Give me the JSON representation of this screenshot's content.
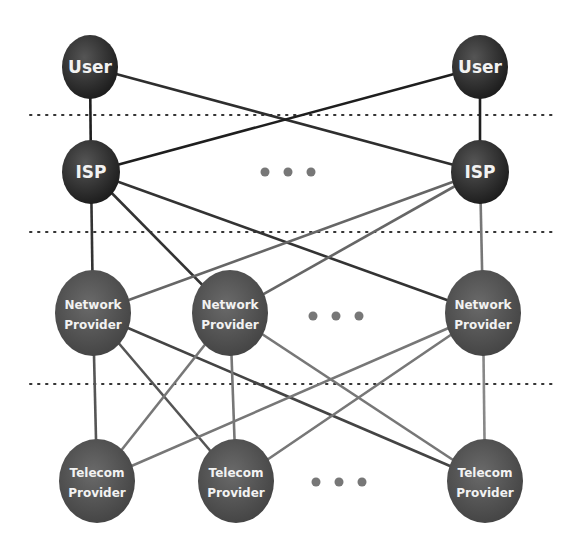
{
  "diagram": {
    "title": "",
    "layers": [
      {
        "name": "user",
        "separator_y": 115
      },
      {
        "name": "isp",
        "separator_y": 232
      },
      {
        "name": "network",
        "separator_y": 384
      },
      {
        "name": "telecom"
      }
    ],
    "nodes": [
      {
        "id": "user1",
        "layer": "user",
        "label": [
          "User"
        ],
        "cx": 90,
        "cy": 67,
        "rx": 28,
        "ry": 32,
        "fill": "#2a2a2a"
      },
      {
        "id": "user2",
        "layer": "user",
        "label": [
          "User"
        ],
        "cx": 480,
        "cy": 67,
        "rx": 28,
        "ry": 32,
        "fill": "#2a2a2a"
      },
      {
        "id": "isp1",
        "layer": "isp",
        "label": [
          "ISP"
        ],
        "cx": 91,
        "cy": 172,
        "rx": 29,
        "ry": 32,
        "fill": "#2a2a2a"
      },
      {
        "id": "isp2",
        "layer": "isp",
        "label": [
          "ISP"
        ],
        "cx": 480,
        "cy": 172,
        "rx": 29,
        "ry": 32,
        "fill": "#2a2a2a"
      },
      {
        "id": "net1",
        "layer": "network",
        "label": [
          "Network",
          "Provider"
        ],
        "cx": 93,
        "cy": 313,
        "rx": 38,
        "ry": 43,
        "fill": "#4d4d4d"
      },
      {
        "id": "net2",
        "layer": "network",
        "label": [
          "Network",
          "Provider"
        ],
        "cx": 230,
        "cy": 313,
        "rx": 38,
        "ry": 43,
        "fill": "#4d4d4d"
      },
      {
        "id": "net3",
        "layer": "network",
        "label": [
          "Network",
          "Provider"
        ],
        "cx": 483,
        "cy": 313,
        "rx": 38,
        "ry": 43,
        "fill": "#4d4d4d"
      },
      {
        "id": "tel1",
        "layer": "telecom",
        "label": [
          "Telecom",
          "Provider"
        ],
        "cx": 97,
        "cy": 481,
        "rx": 38,
        "ry": 42,
        "fill": "#555555"
      },
      {
        "id": "tel2",
        "layer": "telecom",
        "label": [
          "Telecom",
          "Provider"
        ],
        "cx": 236,
        "cy": 481,
        "rx": 38,
        "ry": 42,
        "fill": "#555555"
      },
      {
        "id": "tel3",
        "layer": "telecom",
        "label": [
          "Telecom",
          "Provider"
        ],
        "cx": 485,
        "cy": 481,
        "rx": 38,
        "ry": 42,
        "fill": "#555555"
      }
    ],
    "edges": [
      {
        "from": "user1",
        "to": "isp1",
        "color": "#1e1e1e"
      },
      {
        "from": "user1",
        "to": "isp2",
        "color": "#2e2e2e"
      },
      {
        "from": "user2",
        "to": "isp1",
        "color": "#1e1e1e"
      },
      {
        "from": "user2",
        "to": "isp2",
        "color": "#1e1e1e"
      },
      {
        "from": "isp1",
        "to": "net1",
        "color": "#333333"
      },
      {
        "from": "isp1",
        "to": "net2",
        "color": "#333333"
      },
      {
        "from": "isp1",
        "to": "net3",
        "color": "#333333"
      },
      {
        "from": "isp2",
        "to": "net1",
        "color": "#666666"
      },
      {
        "from": "isp2",
        "to": "net2",
        "color": "#666666"
      },
      {
        "from": "isp2",
        "to": "net3",
        "color": "#777777"
      },
      {
        "from": "net1",
        "to": "tel1",
        "color": "#555555"
      },
      {
        "from": "net1",
        "to": "tel2",
        "color": "#555555"
      },
      {
        "from": "net1",
        "to": "tel3",
        "color": "#444444"
      },
      {
        "from": "net2",
        "to": "tel1",
        "color": "#777777"
      },
      {
        "from": "net2",
        "to": "tel2",
        "color": "#777777"
      },
      {
        "from": "net2",
        "to": "tel3",
        "color": "#777777"
      },
      {
        "from": "net3",
        "to": "tel1",
        "color": "#777777"
      },
      {
        "from": "net3",
        "to": "tel2",
        "color": "#777777"
      },
      {
        "from": "net3",
        "to": "tel3",
        "color": "#888888"
      }
    ],
    "ellipses": [
      {
        "layer": "isp",
        "dots": [
          [
            265,
            172
          ],
          [
            288,
            172
          ],
          [
            311,
            172
          ]
        ]
      },
      {
        "layer": "network",
        "dots": [
          [
            313,
            316
          ],
          [
            336,
            316
          ],
          [
            359,
            316
          ]
        ]
      },
      {
        "layer": "telecom",
        "dots": [
          [
            316,
            482
          ],
          [
            339,
            482
          ],
          [
            362,
            482
          ]
        ]
      }
    ],
    "separator": {
      "x1": 30,
      "x2": 556,
      "color": "#333333"
    },
    "dot_color": "#777777"
  }
}
